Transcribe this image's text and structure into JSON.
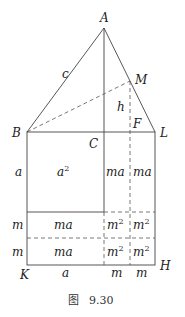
{
  "figure": {
    "caption_prefix": "图",
    "caption_number": "9.30"
  },
  "points": {
    "A": "A",
    "B": "B",
    "C": "C",
    "F": "F",
    "L": "L",
    "M": "M",
    "K": "K",
    "H": "H"
  },
  "segment_labels": {
    "c": "c",
    "h": "h",
    "left_a": "a",
    "left_m1": "m",
    "left_m2": "m",
    "bottom_a": "a",
    "bottom_m1": "m",
    "bottom_m2": "m"
  },
  "regions": {
    "big_square": {
      "base": "a",
      "exp": "2"
    },
    "right_top_1": "ma",
    "right_top_2": "ma",
    "mid_left": "ma",
    "bot_left": "ma",
    "mid_sq1": {
      "base": "m",
      "exp": "2"
    },
    "mid_sq2": {
      "base": "m",
      "exp": "2"
    },
    "bot_sq1": {
      "base": "m",
      "exp": "2"
    },
    "bot_sq2": {
      "base": "m",
      "exp": "2"
    }
  }
}
